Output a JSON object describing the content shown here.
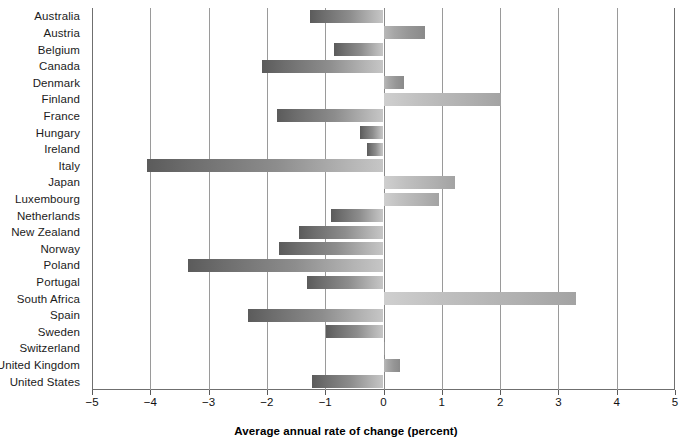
{
  "chart_data": {
    "type": "bar",
    "orientation": "horizontal",
    "title": "",
    "subtitle": "",
    "xlabel": "Average annual rate of change (percent)",
    "ylabel": "",
    "xlim": [
      -5,
      5
    ],
    "xticks": [
      -5,
      -4,
      -3,
      -2,
      -1,
      0,
      1,
      2,
      3,
      4,
      5
    ],
    "xtick_labels": [
      "−5",
      "−4",
      "−3",
      "−2",
      "−1",
      "0",
      "1",
      "2",
      "3",
      "4",
      "5"
    ],
    "grid": "vertical",
    "legend": "none",
    "zero_reference_line": 0,
    "categories": [
      "Australia",
      "Austria",
      "Belgium",
      "Canada",
      "Denmark",
      "Finland",
      "France",
      "Hungary",
      "Ireland",
      "Italy",
      "Japan",
      "Luxembourg",
      "Netherlands",
      "New Zealand",
      "Norway",
      "Poland",
      "Portugal",
      "South Africa",
      "Spain",
      "Sweden",
      "Switzerland",
      "United Kingdom",
      "United States"
    ],
    "values": [
      -1.26,
      0.72,
      -0.85,
      -2.08,
      0.35,
      2.02,
      -1.83,
      -0.4,
      -0.28,
      -4.06,
      1.22,
      0.95,
      -0.9,
      -1.45,
      -1.79,
      -3.35,
      -1.31,
      3.3,
      -2.32,
      -0.98,
      0.03,
      0.28,
      -1.22
    ],
    "colors": {
      "negative_bar_dark": "#5b5b5b",
      "negative_bar_light": "#c6c6c6",
      "positive_bar_dark": "#8a8a8a",
      "positive_bar_light": "#cfcfcf",
      "gridline": "#9a9a9a",
      "axis": "#6f6f6f",
      "text": "#111111",
      "background": "#ffffff"
    }
  }
}
